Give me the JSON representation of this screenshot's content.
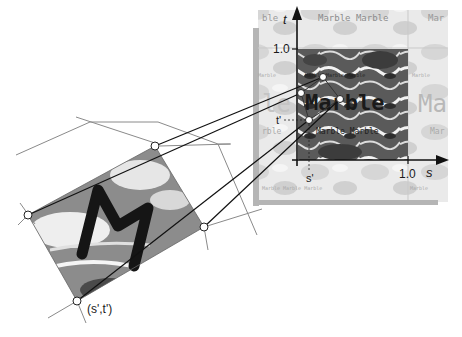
{
  "figure": {
    "type": "texture-mapping-diagram",
    "texture_panel": {
      "axis_t_label": "t",
      "axis_s_label": "s",
      "tick_t": "1.0",
      "tick_s": "1.0",
      "marker_t": "t'",
      "marker_s": "s'",
      "texture_word_large": "Marble",
      "texture_word_ghost": "Ma",
      "texture_word_small": "Marble Marble",
      "texture_word_tiny": "Marble Marble Marble"
    },
    "surface_patch": {
      "letter": "M",
      "point_label": "(s',t')"
    },
    "colors": {
      "mesh_line": "#8a8a8a",
      "projection_line": "#111111",
      "panel_border": "#b5b5b5",
      "texture_dark": "#3a3a3a",
      "texture_light": "#e8e8e8"
    }
  }
}
